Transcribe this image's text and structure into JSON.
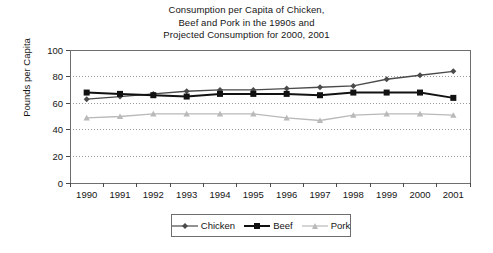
{
  "chart_data": {
    "type": "line",
    "title": "Consumption per Capita of Chicken, Beef and Pork in the 1990s and Projected Consumption for 2000, 2001",
    "title_lines": [
      "Consumption per Capita of Chicken,",
      "Beef and Pork in the 1990s and",
      "Projected Consumption for 2000, 2001"
    ],
    "xlabel": "",
    "ylabel": "Pounds per Capita",
    "categories": [
      "1990",
      "1991",
      "1992",
      "1993",
      "1994",
      "1995",
      "1996",
      "1997",
      "1998",
      "1999",
      "2000",
      "2001"
    ],
    "x": [
      1990,
      1991,
      1992,
      1993,
      1994,
      1995,
      1996,
      1997,
      1998,
      1999,
      2000,
      2001
    ],
    "ylim": [
      0,
      100
    ],
    "yticks": [
      0,
      20,
      40,
      60,
      80,
      100
    ],
    "ytick_labels": [
      "0",
      "20",
      "40",
      "60",
      "80",
      "100"
    ],
    "grid": true,
    "grid_style": "dotted-horizontal",
    "legend_position": "bottom-center",
    "series": [
      {
        "name": "Chicken",
        "color": "#4a4a4a",
        "marker": "diamond",
        "values": [
          63,
          65,
          67,
          69,
          70,
          70,
          71,
          72,
          73,
          78,
          81,
          84
        ]
      },
      {
        "name": "Beef",
        "color": "#111111",
        "marker": "square",
        "values": [
          68,
          67,
          66,
          65,
          67,
          67,
          67,
          66,
          68,
          68,
          68,
          64
        ]
      },
      {
        "name": "Pork",
        "color": "#b9b9b9",
        "marker": "triangle",
        "values": [
          49,
          50,
          52,
          52,
          52,
          52,
          49,
          47,
          51,
          52,
          52,
          51
        ]
      }
    ]
  },
  "legend": {
    "items": [
      {
        "label": "Chicken",
        "color": "#4a4a4a",
        "marker": "diamond"
      },
      {
        "label": "Beef",
        "color": "#111111",
        "marker": "square"
      },
      {
        "label": "Pork",
        "color": "#b9b9b9",
        "marker": "triangle"
      }
    ]
  },
  "axes": {
    "y_title": "Pounds per Capita"
  }
}
